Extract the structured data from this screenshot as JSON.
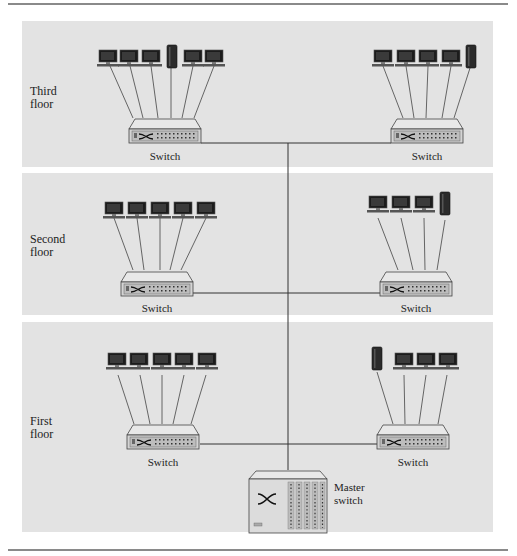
{
  "figure": {
    "floors": [
      {
        "id": "third",
        "label": "Third\nfloor",
        "switches": [
          {
            "id": "third-left",
            "label": "Switch",
            "devices": [
              "computer",
              "computer",
              "computer",
              "server",
              "computer",
              "computer"
            ]
          },
          {
            "id": "third-right",
            "label": "Switch",
            "devices": [
              "computer",
              "computer",
              "computer",
              "computer",
              "server"
            ]
          }
        ]
      },
      {
        "id": "second",
        "label": "Second\nfloor",
        "switches": [
          {
            "id": "second-left",
            "label": "Switch",
            "devices": [
              "computer",
              "computer",
              "computer",
              "computer",
              "computer"
            ]
          },
          {
            "id": "second-right",
            "label": "Switch",
            "devices": [
              "computer",
              "computer",
              "computer",
              "server"
            ]
          }
        ]
      },
      {
        "id": "first",
        "label": "First\nfloor",
        "switches": [
          {
            "id": "first-left",
            "label": "Switch",
            "devices": [
              "computer",
              "computer",
              "computer",
              "computer",
              "computer"
            ]
          },
          {
            "id": "first-right",
            "label": "Switch",
            "devices": [
              "server",
              "computer",
              "computer",
              "computer"
            ]
          }
        ]
      }
    ],
    "master_switch": {
      "label": "Master\nswitch"
    },
    "colors": {
      "panel": "#e3e3e3",
      "line": "#333333",
      "switch_body": "#d6d6d6",
      "monitor": "#1a1a1a",
      "server": "#2a2a2a"
    }
  }
}
